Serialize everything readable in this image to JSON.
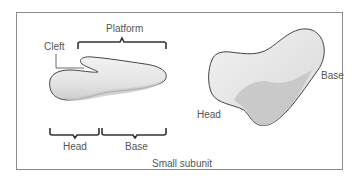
{
  "diagram": {
    "caption": "Small subunit",
    "left_view": {
      "labels": {
        "platform": "Platform",
        "cleft": "Cleft",
        "head": "Head",
        "base": "Base"
      }
    },
    "right_view": {
      "labels": {
        "head": "Head",
        "base": "Base"
      }
    }
  },
  "colors": {
    "border": "#8a8a8a",
    "shape_fill": "#e6e6e6",
    "shape_shadow": "#c4c4c4",
    "outline": "#555555",
    "text": "#555555"
  }
}
